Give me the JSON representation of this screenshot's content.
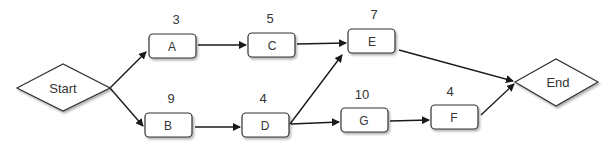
{
  "diagram": {
    "type": "activity-network",
    "start": {
      "label": "Start"
    },
    "end": {
      "label": "End"
    },
    "activities": [
      {
        "id": "A",
        "label": "A",
        "duration": "3"
      },
      {
        "id": "B",
        "label": "B",
        "duration": "9"
      },
      {
        "id": "C",
        "label": "C",
        "duration": "5"
      },
      {
        "id": "D",
        "label": "D",
        "duration": "4"
      },
      {
        "id": "E",
        "label": "E",
        "duration": "7"
      },
      {
        "id": "F",
        "label": "F",
        "duration": "4"
      },
      {
        "id": "G",
        "label": "G",
        "duration": "10"
      }
    ],
    "edges": [
      [
        "Start",
        "A"
      ],
      [
        "Start",
        "B"
      ],
      [
        "A",
        "C"
      ],
      [
        "C",
        "E"
      ],
      [
        "B",
        "D"
      ],
      [
        "D",
        "E"
      ],
      [
        "D",
        "G"
      ],
      [
        "G",
        "F"
      ],
      [
        "E",
        "End"
      ],
      [
        "F",
        "End"
      ]
    ]
  }
}
